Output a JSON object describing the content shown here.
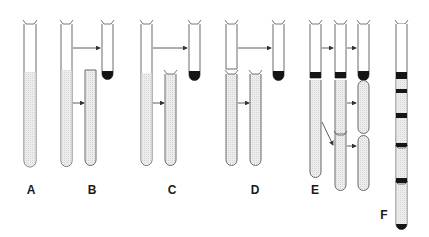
{
  "figure": {
    "colors": {
      "outline": "#6b6b6b",
      "shade": "#e4e4e4",
      "band": "#151515",
      "background": "#ffffff"
    },
    "panels": [
      {
        "id": "A",
        "label": "A",
        "label_x": 31,
        "label_y": 190
      },
      {
        "id": "B",
        "label": "B",
        "label_x": 92,
        "label_y": 190
      },
      {
        "id": "C",
        "label": "C",
        "label_x": 172,
        "label_y": 190
      },
      {
        "id": "D",
        "label": "D",
        "label_x": 255,
        "label_y": 190
      },
      {
        "id": "E",
        "label": "E",
        "label_x": 315,
        "label_y": 190
      },
      {
        "id": "F",
        "label": "F",
        "label_x": 384,
        "label_y": 215
      }
    ]
  }
}
